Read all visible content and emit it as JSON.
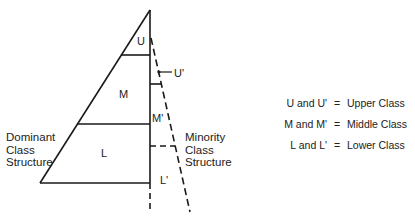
{
  "diagram": {
    "dominant_triangle": {
      "title_lines": [
        "Dominant",
        "Class",
        "Structure"
      ],
      "sections": [
        {
          "key": "U",
          "label": "U"
        },
        {
          "key": "M",
          "label": "M"
        },
        {
          "key": "L",
          "label": "L"
        }
      ]
    },
    "minority_triangle": {
      "title_lines": [
        "Minority",
        "Class",
        "Structure"
      ],
      "sections": [
        {
          "key": "U'",
          "label": "U'"
        },
        {
          "key": "M'",
          "label": "M'"
        },
        {
          "key": "L'",
          "label": "L'"
        }
      ]
    },
    "legend": [
      {
        "key": "U and U'",
        "eq": "=",
        "value": "Upper Class"
      },
      {
        "key": "M and M'",
        "eq": "=",
        "value": "Middle Class"
      },
      {
        "key": "L and L'",
        "eq": "=",
        "value": "Lower Class"
      }
    ],
    "colors": {
      "line": "#1a1a1a",
      "text": "#222222",
      "background": "#ffffff"
    }
  }
}
